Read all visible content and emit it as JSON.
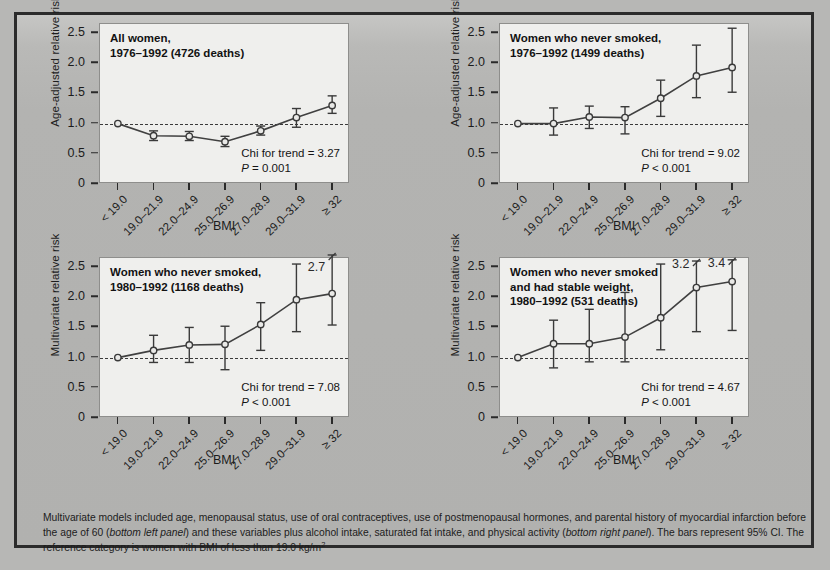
{
  "figure": {
    "background_color": "#b7b7b5",
    "panel_color": "#efefed",
    "frame_color": "#2b2b2b",
    "footnote": "Multivariate models included age, menopausal status, use of oral contraceptives, use of postmenopausal hormones, and parental history of myocardial infarction before the age of 60 (bottom left panel) and these variables plus alcohol intake, saturated fat intake, and physical activity (bottom right panel).  The bars represent 95% CI.  The reference category is women with BMI of less than 19.0 kg/m",
    "footnote_sup": "2"
  },
  "chart_data": [
    {
      "id": "panel-top-left",
      "type": "line",
      "title": "All women,\n1976–1992 (4726 deaths)",
      "title_line1": "All women,",
      "title_line2": "1976–1992 (4726 deaths)",
      "xlabel": "BMI",
      "ylabel": "Age-adjusted relative risk",
      "categories": [
        "< 19.0",
        "19.0–21.9",
        "22.0–24.9",
        "25.0–26.9",
        "27.0–28.9",
        "29.0–31.9",
        "≥ 32"
      ],
      "values": [
        1.0,
        0.8,
        0.79,
        0.7,
        0.88,
        1.1,
        1.3
      ],
      "ci_low": [
        1.0,
        0.72,
        0.72,
        0.62,
        0.81,
        0.94,
        1.17
      ],
      "ci_high": [
        1.0,
        0.88,
        0.87,
        0.79,
        0.96,
        1.25,
        1.46
      ],
      "reference_line": 1.0,
      "ylim": [
        0,
        2.65
      ],
      "yticks": [
        "0",
        "0.5",
        "1.0",
        "1.5",
        "2.0",
        "2.5"
      ],
      "ytickvals": [
        0,
        0.5,
        1.0,
        1.5,
        2.0,
        2.5
      ],
      "stat_line1": "Chi for trend = 3.27",
      "stat_p_italic": "P",
      "stat_p_rest": " = 0.001",
      "annotations": []
    },
    {
      "id": "panel-top-right",
      "type": "line",
      "title_line1": "Women who never smoked,",
      "title_line2": "1976–1992 (1499 deaths)",
      "xlabel": "BMI",
      "ylabel": "Age-adjusted relative risk",
      "categories": [
        "< 19.0",
        "19.0–21.9",
        "22.0–24.9",
        "25.0–26.9",
        "27.0–28.9",
        "29.0–31.9",
        "≥ 32"
      ],
      "values": [
        1.0,
        1.0,
        1.11,
        1.1,
        1.42,
        1.79,
        1.93
      ],
      "ci_low": [
        1.0,
        0.81,
        0.92,
        0.83,
        1.12,
        1.43,
        1.52
      ],
      "ci_high": [
        1.0,
        1.26,
        1.29,
        1.28,
        1.72,
        2.3,
        2.58
      ],
      "reference_line": 1.0,
      "ylim": [
        0,
        2.65
      ],
      "yticks": [
        "0",
        "0.5",
        "1.0",
        "1.5",
        "2.0",
        "2.5"
      ],
      "ytickvals": [
        0,
        0.5,
        1.0,
        1.5,
        2.0,
        2.5
      ],
      "stat_line1": "Chi for trend = 9.02",
      "stat_p_italic": "P",
      "stat_p_rest": " < 0.001",
      "annotations": []
    },
    {
      "id": "panel-bottom-left",
      "type": "line",
      "title_line1": "Women who never smoked,",
      "title_line2": "1980–1992 (1168 deaths)",
      "xlabel": "BMI",
      "ylabel": "Multivariate relative risk",
      "categories": [
        "< 19.0",
        "19.0–21.9",
        "22.0–24.9",
        "25.0–26.9",
        "27.0–28.9",
        "29.0–31.9",
        "≥ 32"
      ],
      "values": [
        1.0,
        1.12,
        1.21,
        1.22,
        1.55,
        1.96,
        2.06
      ],
      "ci_low": [
        1.0,
        0.92,
        0.92,
        0.8,
        1.12,
        1.43,
        1.54
      ],
      "ci_high": [
        1.0,
        1.37,
        1.5,
        1.52,
        1.91,
        2.55,
        2.7
      ],
      "reference_line": 1.0,
      "ylim": [
        0,
        2.65
      ],
      "yticks": [
        "0",
        "0.5",
        "1.0",
        "1.5",
        "2.0",
        "2.5"
      ],
      "ytickvals": [
        0,
        0.5,
        1.0,
        1.5,
        2.0,
        2.5
      ],
      "stat_line1": "Chi for trend = 7.08",
      "stat_p_italic": "P",
      "stat_p_rest": " < 0.001",
      "annotations": [
        {
          "index": 6,
          "text": "2.7",
          "value": 2.55,
          "truncated": true
        }
      ]
    },
    {
      "id": "panel-bottom-right",
      "type": "line",
      "title_line1": "Women who never smoked",
      "title_line2": "and had stable weight,",
      "title_line3": "1980–1992 (531 deaths)",
      "xlabel": "BMI",
      "ylabel": "Multivariate relative risk",
      "categories": [
        "< 19.0",
        "19.0–21.9",
        "22.0–24.9",
        "25.0–26.9",
        "27.0–28.9",
        "29.0–31.9",
        "≥ 32"
      ],
      "values": [
        1.0,
        1.23,
        1.23,
        1.34,
        1.66,
        2.16,
        2.26
      ],
      "ci_low": [
        1.0,
        0.83,
        0.93,
        0.93,
        1.13,
        1.43,
        1.45
      ],
      "ci_high": [
        1.0,
        1.62,
        1.8,
        2.08,
        2.55,
        2.6,
        2.62
      ],
      "reference_line": 1.0,
      "ylim": [
        0,
        2.65
      ],
      "yticks": [
        "0",
        "0.5",
        "1.0",
        "1.5",
        "2.0",
        "2.5"
      ],
      "ytickvals": [
        0,
        0.5,
        1.0,
        1.5,
        2.0,
        2.5
      ],
      "stat_line1": "Chi for trend = 4.67",
      "stat_p_italic": "P",
      "stat_p_rest": " < 0.001",
      "annotations": [
        {
          "index": 5,
          "text": "3.2",
          "value": 2.6,
          "truncated": true
        },
        {
          "index": 6,
          "text": "3.4",
          "value": 2.62,
          "truncated": true
        }
      ]
    }
  ]
}
